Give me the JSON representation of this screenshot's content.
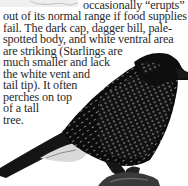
{
  "document": {
    "lines": [
      "occasionally “erupts”",
      "out of its normal range if food supplies",
      "fail. The dark cap, dagger bill, pale-",
      "spotted body, and white ventral area",
      "are striking (Starlings are",
      "much smaller and lack",
      "the white vent and",
      "tail tip). It often",
      "perches on top",
      "of a tall",
      "tree."
    ]
  },
  "images": {
    "top_fragment": "map-fragment",
    "bird_photo": "nutcracker-bird-photo"
  }
}
